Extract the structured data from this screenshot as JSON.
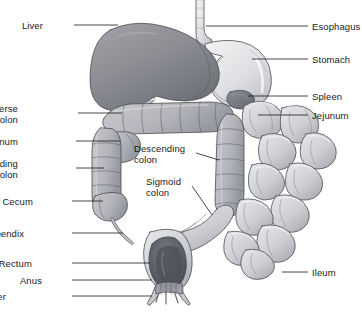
{
  "figure": {
    "background_color": "#ffffff",
    "width": 362,
    "height": 313,
    "line_color": "#1a1a1a",
    "text_color": "#1a1a1a"
  },
  "palette": {
    "liver_fill": "#8f9196",
    "liver_dark": "#6f7178",
    "stomach_fill": "#e4e5e7",
    "stomach_shade": "#c3c5c9",
    "colon_fill": "#b9bbc0",
    "colon_shade": "#9a9ca2",
    "intestine_fill": "#d5d6d9",
    "intestine_shade": "#a9abb0",
    "rectum_dark": "#555860",
    "spleen_fill": "#7b7d84",
    "outline": "#4a4c52"
  },
  "labels": {
    "left": [
      {
        "id": "liver",
        "text": "Liver",
        "lines": [
          "Liver"
        ],
        "x": 43,
        "y": 20,
        "leader": {
          "x1": 74,
          "y1": 25,
          "x2": 118,
          "y2": 25
        }
      },
      {
        "id": "transverse-colon",
        "text": "Tranverse colon",
        "lines": [
          "Tranverse",
          "colon"
        ],
        "x": 18,
        "y": 103,
        "leader": {
          "x1": 78,
          "y1": 113,
          "x2": 122,
          "y2": 113
        }
      },
      {
        "id": "duodenum",
        "text": "Duodenum",
        "lines": [
          "Duodenum"
        ],
        "x": 18,
        "y": 136,
        "leader": {
          "x1": 76,
          "y1": 141,
          "x2": 120,
          "y2": 141
        }
      },
      {
        "id": "ascending-colon",
        "text": "Ascending colon",
        "lines": [
          "Ascending",
          "colon"
        ],
        "x": 18,
        "y": 158,
        "leader": {
          "x1": 76,
          "y1": 168,
          "x2": 104,
          "y2": 168
        }
      },
      {
        "id": "cecum",
        "text": "Cecum",
        "lines": [
          "Cecum"
        ],
        "x": 33,
        "y": 196,
        "leader": {
          "x1": 72,
          "y1": 201,
          "x2": 103,
          "y2": 201
        }
      },
      {
        "id": "appendix",
        "text": "Appendix",
        "lines": [
          "Appendix"
        ],
        "x": 24,
        "y": 228,
        "leader": {
          "x1": 72,
          "y1": 233,
          "x2": 123,
          "y2": 233
        }
      },
      {
        "id": "rectum",
        "text": "Rectum",
        "lines": [
          "Rectum"
        ],
        "x": 32,
        "y": 258,
        "leader": {
          "x1": 72,
          "y1": 263,
          "x2": 150,
          "y2": 263
        }
      },
      {
        "id": "anus",
        "text": "Anus",
        "lines": [
          "Anus"
        ],
        "x": 42,
        "y": 275,
        "leader": {
          "x1": 72,
          "y1": 280,
          "x2": 152,
          "y2": 280
        }
      },
      {
        "id": "anal-sphincter",
        "text": "Anal sphincter",
        "lines": [
          "Anal sphincter"
        ],
        "x": 6,
        "y": 291,
        "leader": {
          "x1": 72,
          "y1": 296,
          "x2": 152,
          "y2": 296
        }
      }
    ],
    "right": [
      {
        "id": "esophagus",
        "text": "Esophagus",
        "lines": [
          "Esophagus"
        ],
        "x": 312,
        "y": 21,
        "leader": {
          "x1": 206,
          "y1": 26,
          "x2": 308,
          "y2": 26
        }
      },
      {
        "id": "stomach",
        "text": "Stomach",
        "lines": [
          "Stomach"
        ],
        "x": 312,
        "y": 54,
        "leader": {
          "x1": 252,
          "y1": 59,
          "x2": 308,
          "y2": 59
        }
      },
      {
        "id": "spleen",
        "text": "Spleen",
        "lines": [
          "Spleen"
        ],
        "x": 312,
        "y": 91,
        "leader": {
          "x1": 248,
          "y1": 96,
          "x2": 308,
          "y2": 96
        }
      },
      {
        "id": "jejunum",
        "text": "Jejunum",
        "lines": [
          "Jejunum"
        ],
        "x": 312,
        "y": 110,
        "leader": {
          "x1": 258,
          "y1": 115,
          "x2": 308,
          "y2": 115
        }
      },
      {
        "id": "ileum",
        "text": "Ileum",
        "lines": [
          "Ileum"
        ],
        "x": 312,
        "y": 267,
        "leader": {
          "x1": 282,
          "y1": 272,
          "x2": 308,
          "y2": 272
        }
      }
    ],
    "inner": [
      {
        "id": "descending-colon",
        "text": "Descending colon",
        "lines": [
          "Descending",
          "colon"
        ],
        "x": 134,
        "y": 143,
        "leader": {
          "x1": 196,
          "y1": 153,
          "x2": 219,
          "y2": 160
        }
      },
      {
        "id": "sigmoid-colon",
        "text": "Sigmoid colon",
        "lines": [
          "Sigmoid",
          "colon"
        ],
        "x": 146,
        "y": 176,
        "leader": {
          "x1": 192,
          "y1": 186,
          "x2": 212,
          "y2": 215
        }
      }
    ]
  },
  "organs": [
    {
      "id": "liver",
      "name": "Liver"
    },
    {
      "id": "stomach",
      "name": "Stomach"
    },
    {
      "id": "esophagus",
      "name": "Esophagus"
    },
    {
      "id": "spleen",
      "name": "Spleen"
    },
    {
      "id": "transverse-colon",
      "name": "Tranverse colon"
    },
    {
      "id": "descending-colon",
      "name": "Descending colon"
    },
    {
      "id": "ascending-colon",
      "name": "Ascending colon"
    },
    {
      "id": "duodenum",
      "name": "Duodenum"
    },
    {
      "id": "jejunum",
      "name": "Jejunum"
    },
    {
      "id": "ileum",
      "name": "Ileum"
    },
    {
      "id": "cecum",
      "name": "Cecum"
    },
    {
      "id": "appendix",
      "name": "Appendix"
    },
    {
      "id": "sigmoid-colon",
      "name": "Sigmoid colon"
    },
    {
      "id": "rectum",
      "name": "Rectum"
    },
    {
      "id": "anus",
      "name": "Anus"
    },
    {
      "id": "anal-sphincter",
      "name": "Anal sphincter"
    }
  ]
}
